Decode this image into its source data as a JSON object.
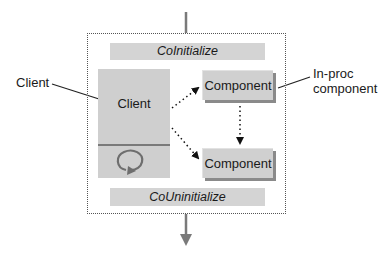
{
  "diagram": {
    "title_bars": {
      "top": "CoInitialize",
      "bottom": "CoUninitialize"
    },
    "client_box": {
      "label": "Client",
      "loop_icon": "circular-arrow-icon"
    },
    "components": [
      {
        "label": "Component"
      },
      {
        "label": "Component"
      }
    ],
    "callouts": {
      "client": "Client",
      "in_proc_line1": "In-proc",
      "in_proc_line2": "component"
    },
    "colors": {
      "box_fill": "#d0d0d0",
      "shadow": "#8a8a8a",
      "arrow": "#7a7a7a",
      "dotted": "#555555"
    }
  }
}
